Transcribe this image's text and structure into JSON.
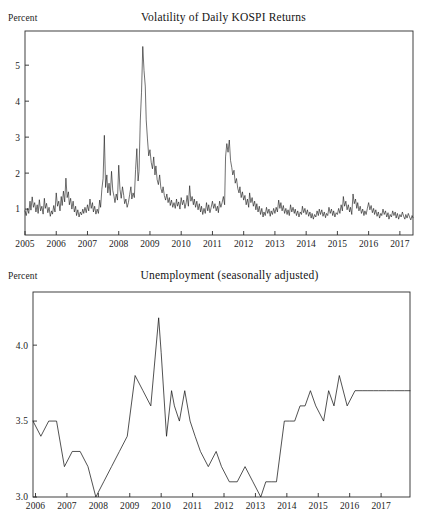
{
  "figure": {
    "background_color": "#ffffff",
    "line_color": "#181818",
    "axis_color": "#2b2b2b"
  },
  "panels": [
    {
      "unit_label": "Percent",
      "title": "Volatility of Daily KOSPI Returns"
    },
    {
      "unit_label": "Percent",
      "title": "Unemployment (seasonally adjusted)"
    }
  ],
  "chart_data": [
    {
      "type": "line",
      "title": "Volatility of Daily KOSPI Returns",
      "xlabel": "",
      "ylabel": "Percent",
      "grid": false,
      "legend": "none",
      "xlim": [
        2005.0,
        2017.42
      ],
      "ylim": [
        0.28,
        5.95
      ],
      "yticks": [
        1,
        2,
        3,
        4,
        5
      ],
      "ytick_labels": [
        "1",
        "2",
        "3",
        "4",
        "5"
      ],
      "xticks": [
        2005,
        2006,
        2007,
        2008,
        2009,
        2010,
        2011,
        2012,
        2013,
        2014,
        2015,
        2016,
        2017
      ],
      "xtick_labels": [
        "2005",
        "2006",
        "2007",
        "2008",
        "2009",
        "2010",
        "2011",
        "2012",
        "2013",
        "2014",
        "2015",
        "2016",
        "2017"
      ],
      "series": [
        {
          "name": "Volatility of daily KOSPI returns",
          "x": [
            2005.0,
            2005.04,
            2005.08,
            2005.12,
            2005.16,
            2005.19,
            2005.23,
            2005.27,
            2005.31,
            2005.35,
            2005.39,
            2005.42,
            2005.46,
            2005.5,
            2005.54,
            2005.58,
            2005.62,
            2005.65,
            2005.69,
            2005.73,
            2005.77,
            2005.81,
            2005.85,
            2005.88,
            2005.92,
            2005.96,
            2006.0,
            2006.04,
            2006.08,
            2006.12,
            2006.16,
            2006.19,
            2006.23,
            2006.27,
            2006.31,
            2006.35,
            2006.39,
            2006.42,
            2006.46,
            2006.5,
            2006.54,
            2006.58,
            2006.62,
            2006.65,
            2006.69,
            2006.73,
            2006.77,
            2006.81,
            2006.85,
            2006.88,
            2006.92,
            2006.96,
            2007.0,
            2007.04,
            2007.08,
            2007.12,
            2007.16,
            2007.19,
            2007.23,
            2007.27,
            2007.31,
            2007.35,
            2007.39,
            2007.42,
            2007.46,
            2007.5,
            2007.54,
            2007.58,
            2007.62,
            2007.65,
            2007.69,
            2007.73,
            2007.77,
            2007.81,
            2007.85,
            2007.88,
            2007.92,
            2007.96,
            2008.0,
            2008.04,
            2008.08,
            2008.12,
            2008.16,
            2008.19,
            2008.23,
            2008.27,
            2008.31,
            2008.35,
            2008.39,
            2008.42,
            2008.46,
            2008.5,
            2008.54,
            2008.58,
            2008.62,
            2008.65,
            2008.69,
            2008.73,
            2008.77,
            2008.81,
            2008.85,
            2008.88,
            2008.92,
            2008.96,
            2009.0,
            2009.04,
            2009.08,
            2009.12,
            2009.16,
            2009.19,
            2009.23,
            2009.27,
            2009.31,
            2009.35,
            2009.39,
            2009.42,
            2009.46,
            2009.5,
            2009.54,
            2009.58,
            2009.62,
            2009.65,
            2009.69,
            2009.73,
            2009.77,
            2009.81,
            2009.85,
            2009.88,
            2009.92,
            2009.96,
            2010.0,
            2010.04,
            2010.08,
            2010.12,
            2010.16,
            2010.19,
            2010.23,
            2010.27,
            2010.31,
            2010.35,
            2010.39,
            2010.42,
            2010.46,
            2010.5,
            2010.54,
            2010.58,
            2010.62,
            2010.65,
            2010.69,
            2010.73,
            2010.77,
            2010.81,
            2010.85,
            2010.88,
            2010.92,
            2010.96,
            2011.0,
            2011.04,
            2011.08,
            2011.12,
            2011.16,
            2011.19,
            2011.23,
            2011.27,
            2011.31,
            2011.35,
            2011.39,
            2011.42,
            2011.46,
            2011.5,
            2011.54,
            2011.58,
            2011.62,
            2011.65,
            2011.69,
            2011.73,
            2011.77,
            2011.81,
            2011.85,
            2011.88,
            2011.92,
            2011.96,
            2012.0,
            2012.04,
            2012.08,
            2012.12,
            2012.16,
            2012.19,
            2012.23,
            2012.27,
            2012.31,
            2012.35,
            2012.39,
            2012.42,
            2012.46,
            2012.5,
            2012.54,
            2012.58,
            2012.62,
            2012.65,
            2012.69,
            2012.73,
            2012.77,
            2012.81,
            2012.85,
            2012.88,
            2012.92,
            2012.96,
            2013.0,
            2013.04,
            2013.08,
            2013.12,
            2013.16,
            2013.19,
            2013.23,
            2013.27,
            2013.31,
            2013.35,
            2013.39,
            2013.42,
            2013.46,
            2013.5,
            2013.54,
            2013.58,
            2013.62,
            2013.65,
            2013.69,
            2013.73,
            2013.77,
            2013.81,
            2013.85,
            2013.88,
            2013.92,
            2013.96,
            2014.0,
            2014.04,
            2014.08,
            2014.12,
            2014.16,
            2014.19,
            2014.23,
            2014.27,
            2014.31,
            2014.35,
            2014.39,
            2014.42,
            2014.46,
            2014.5,
            2014.54,
            2014.58,
            2014.62,
            2014.65,
            2014.69,
            2014.73,
            2014.77,
            2014.81,
            2014.85,
            2014.88,
            2014.92,
            2014.96,
            2015.0,
            2015.04,
            2015.08,
            2015.12,
            2015.16,
            2015.19,
            2015.23,
            2015.27,
            2015.31,
            2015.35,
            2015.39,
            2015.42,
            2015.46,
            2015.5,
            2015.54,
            2015.58,
            2015.62,
            2015.65,
            2015.69,
            2015.73,
            2015.77,
            2015.81,
            2015.85,
            2015.88,
            2015.92,
            2015.96,
            2016.0,
            2016.04,
            2016.08,
            2016.12,
            2016.16,
            2016.19,
            2016.23,
            2016.27,
            2016.31,
            2016.35,
            2016.39,
            2016.42,
            2016.46,
            2016.5,
            2016.54,
            2016.58,
            2016.62,
            2016.65,
            2016.69,
            2016.73,
            2016.77,
            2016.81,
            2016.85,
            2016.88,
            2016.92,
            2016.96,
            2017.0,
            2017.04,
            2017.08,
            2017.12,
            2017.16,
            2017.19,
            2017.23,
            2017.27,
            2017.31,
            2017.35,
            2017.39,
            2017.42
          ],
          "values": [
            0.95,
            0.82,
            1.02,
            0.88,
            1.22,
            0.97,
            1.34,
            1.05,
            1.18,
            0.92,
            1.12,
            0.88,
            1.26,
            0.95,
            1.08,
            0.86,
            1.3,
            1.02,
            1.16,
            0.9,
            1.05,
            0.8,
            0.95,
            0.86,
            1.1,
            0.92,
            1.45,
            1.08,
            1.22,
            0.95,
            1.35,
            1.1,
            1.5,
            1.2,
            1.86,
            1.32,
            1.48,
            1.12,
            1.3,
            1.0,
            1.22,
            0.92,
            1.08,
            0.82,
            0.98,
            0.78,
            0.92,
            0.84,
            1.0,
            0.88,
            1.05,
            0.9,
            1.12,
            0.95,
            1.28,
            1.02,
            1.18,
            0.92,
            1.08,
            0.86,
            1.0,
            0.88,
            1.25,
            1.05,
            1.55,
            1.85,
            3.05,
            1.6,
            1.95,
            1.45,
            1.72,
            1.38,
            2.05,
            1.52,
            1.35,
            1.18,
            1.42,
            1.25,
            2.22,
            1.55,
            1.3,
            1.62,
            1.38,
            1.15,
            1.28,
            1.05,
            1.18,
            1.4,
            1.62,
            1.28,
            1.45,
            1.32,
            2.1,
            2.68,
            1.78,
            2.05,
            3.45,
            4.25,
            5.52,
            4.85,
            4.42,
            3.48,
            2.95,
            2.48,
            2.65,
            2.3,
            2.12,
            2.45,
            1.95,
            2.2,
            1.82,
            1.68,
            1.95,
            1.58,
            1.45,
            1.62,
            1.38,
            1.25,
            1.42,
            1.18,
            1.32,
            1.1,
            1.25,
            1.05,
            1.18,
            1.02,
            1.28,
            1.08,
            1.2,
            1.0,
            1.32,
            1.12,
            1.25,
            1.02,
            1.18,
            1.38,
            1.08,
            1.65,
            1.22,
            1.35,
            1.12,
            1.28,
            1.05,
            1.22,
            0.98,
            1.15,
            0.92,
            1.08,
            0.85,
            1.02,
            0.88,
            1.18,
            0.95,
            1.12,
            0.9,
            1.05,
            1.22,
            1.02,
            1.15,
            0.95,
            1.08,
            0.9,
            1.22,
            1.05,
            1.18,
            1.35,
            1.12,
            2.45,
            2.82,
            2.58,
            2.92,
            2.35,
            2.15,
            1.95,
            2.08,
            1.72,
            1.85,
            1.58,
            1.45,
            1.62,
            1.32,
            1.48,
            1.25,
            1.38,
            1.12,
            1.28,
            1.05,
            1.45,
            1.18,
            1.32,
            1.08,
            1.22,
            0.98,
            1.15,
            0.92,
            1.08,
            0.85,
            1.02,
            0.78,
            0.92,
            0.82,
            1.05,
            0.88,
            1.0,
            0.8,
            0.95,
            0.85,
            1.02,
            0.88,
            1.05,
            0.92,
            1.25,
            1.02,
            1.18,
            0.95,
            1.1,
            0.88,
            1.02,
            0.85,
            0.98,
            0.82,
            1.12,
            0.92,
            1.05,
            0.88,
            1.0,
            0.82,
            0.95,
            0.78,
            0.92,
            0.85,
            1.08,
            0.9,
            1.02,
            0.85,
            0.98,
            0.8,
            0.92,
            0.75,
            0.88,
            0.72,
            0.85,
            0.78,
            0.95,
            0.82,
            1.0,
            0.85,
            0.98,
            0.8,
            0.92,
            0.76,
            0.88,
            0.82,
            1.05,
            0.88,
            1.0,
            0.82,
            0.95,
            0.78,
            0.9,
            0.85,
            1.02,
            0.88,
            1.12,
            0.95,
            1.35,
            1.08,
            1.22,
            0.98,
            1.12,
            0.92,
            1.05,
            0.85,
            1.42,
            1.15,
            1.28,
            1.02,
            1.18,
            0.95,
            1.08,
            0.88,
            1.0,
            0.82,
            0.95,
            0.85,
            1.02,
            1.18,
            0.98,
            1.1,
            0.9,
            1.02,
            0.85,
            0.98,
            0.8,
            0.92,
            0.75,
            0.88,
            0.82,
            1.0,
            0.85,
            0.95,
            0.78,
            0.9,
            0.72,
            0.85,
            0.78,
            0.95,
            0.82,
            0.92,
            0.75,
            0.88,
            0.72,
            0.85,
            0.78,
            0.92,
            0.8,
            0.72,
            0.85,
            0.75,
            0.88,
            0.78,
            0.7,
            0.82,
            0.76
          ]
        }
      ]
    },
    {
      "type": "line",
      "title": "Unemployment (seasonally adjusted)",
      "xlabel": "",
      "ylabel": "Percent",
      "grid": false,
      "legend": "none",
      "xlim": [
        2005.92,
        2017.92
      ],
      "ylim": [
        3.0,
        4.35
      ],
      "yticks": [
        3.0,
        3.5,
        4.0
      ],
      "ytick_labels": [
        "3.0",
        "3.5",
        "4.0"
      ],
      "xticks": [
        2006,
        2007,
        2008,
        2009,
        2010,
        2011,
        2012,
        2013,
        2014,
        2015,
        2016,
        2017
      ],
      "xtick_labels": [
        "2006",
        "2007",
        "2008",
        "2009",
        "2010",
        "2011",
        "2012",
        "2013",
        "2014",
        "2015",
        "2016",
        "2017"
      ],
      "series": [
        {
          "name": "Unemployment rate (seasonally adjusted)",
          "x": [
            2005.92,
            2006.17,
            2006.42,
            2006.67,
            2006.92,
            2007.17,
            2007.42,
            2007.67,
            2007.92,
            2008.17,
            2008.42,
            2008.67,
            2008.92,
            2009.17,
            2009.42,
            2009.67,
            2009.92,
            2010.0,
            2010.17,
            2010.33,
            2010.42,
            2010.58,
            2010.75,
            2010.92,
            2011.08,
            2011.25,
            2011.5,
            2011.75,
            2011.92,
            2012.17,
            2012.42,
            2012.67,
            2012.92,
            2013.17,
            2013.33,
            2013.5,
            2013.67,
            2013.92,
            2014.08,
            2014.25,
            2014.42,
            2014.58,
            2014.75,
            2014.92,
            2015.17,
            2015.33,
            2015.5,
            2015.67,
            2015.92,
            2016.17,
            2016.42,
            2016.58,
            2016.75,
            2016.92,
            2017.17,
            2017.42,
            2017.75,
            2017.92
          ],
          "values": [
            3.5,
            3.4,
            3.5,
            3.5,
            3.2,
            3.3,
            3.3,
            3.2,
            3.0,
            3.1,
            3.2,
            3.3,
            3.4,
            3.8,
            3.7,
            3.6,
            4.18,
            3.95,
            3.4,
            3.7,
            3.6,
            3.5,
            3.7,
            3.5,
            3.4,
            3.3,
            3.2,
            3.3,
            3.2,
            3.1,
            3.1,
            3.2,
            3.1,
            3.0,
            3.1,
            3.1,
            3.1,
            3.5,
            3.5,
            3.5,
            3.6,
            3.6,
            3.7,
            3.6,
            3.5,
            3.7,
            3.6,
            3.8,
            3.6,
            3.7,
            3.7,
            3.7,
            3.7,
            3.7,
            3.7,
            3.7,
            3.7,
            3.7
          ]
        }
      ]
    }
  ]
}
